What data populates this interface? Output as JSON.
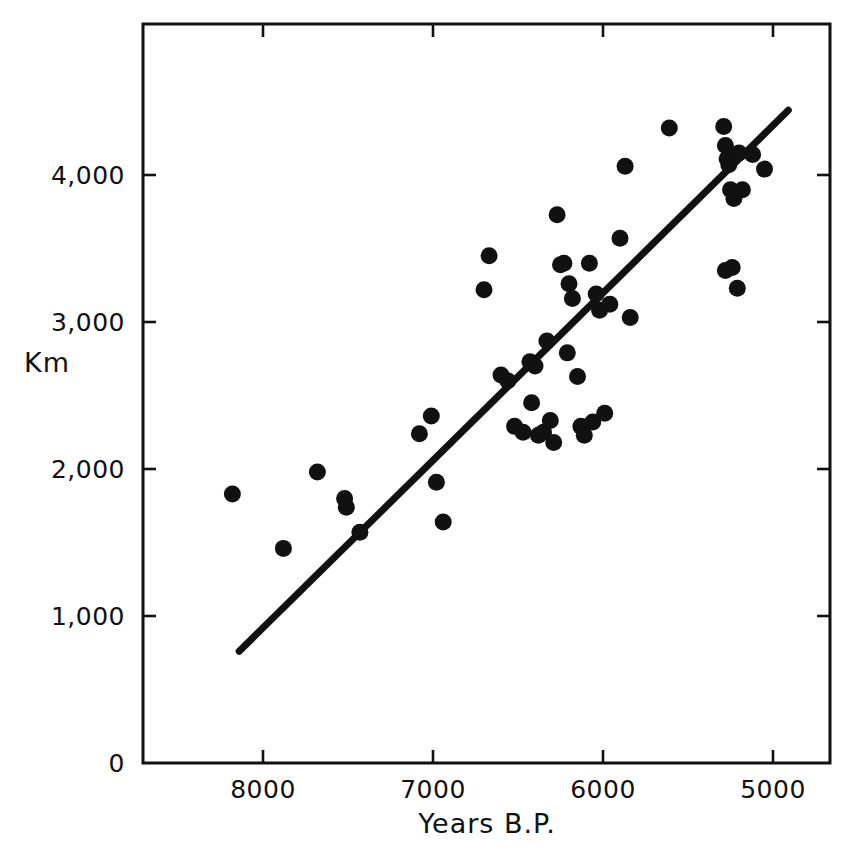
{
  "chart_data": {
    "type": "scatter",
    "title": "",
    "xlabel": "Years B.P.",
    "ylabel": "Km",
    "xlim": [
      8350,
      4670
    ],
    "ylim": [
      0,
      4500
    ],
    "x_ticks": [
      8000,
      7000,
      6000,
      5000
    ],
    "x_tick_labels": [
      "8000",
      "7000",
      "6000",
      "5000"
    ],
    "y_ticks": [
      0,
      1000,
      2000,
      3000,
      4000
    ],
    "y_tick_labels": [
      "0",
      "1,000",
      "2,000",
      "3,000",
      "4,000"
    ],
    "x_axis_inverted": true,
    "grid": false,
    "legend": false,
    "marker_color": "#111111",
    "line_color": "#111111",
    "points": [
      {
        "x": 8180,
        "y": 1830
      },
      {
        "x": 7880,
        "y": 1460
      },
      {
        "x": 7680,
        "y": 1980
      },
      {
        "x": 7520,
        "y": 1800
      },
      {
        "x": 7510,
        "y": 1740
      },
      {
        "x": 7430,
        "y": 1570
      },
      {
        "x": 7080,
        "y": 2240
      },
      {
        "x": 7010,
        "y": 2360
      },
      {
        "x": 6980,
        "y": 1910
      },
      {
        "x": 6940,
        "y": 1640
      },
      {
        "x": 6700,
        "y": 3220
      },
      {
        "x": 6670,
        "y": 3450
      },
      {
        "x": 6600,
        "y": 2640
      },
      {
        "x": 6560,
        "y": 2600
      },
      {
        "x": 6520,
        "y": 2290
      },
      {
        "x": 6470,
        "y": 2250
      },
      {
        "x": 6430,
        "y": 2730
      },
      {
        "x": 6420,
        "y": 2450
      },
      {
        "x": 6400,
        "y": 2700
      },
      {
        "x": 6380,
        "y": 2230
      },
      {
        "x": 6350,
        "y": 2250
      },
      {
        "x": 6330,
        "y": 2870
      },
      {
        "x": 6310,
        "y": 2330
      },
      {
        "x": 6290,
        "y": 2180
      },
      {
        "x": 6270,
        "y": 3730
      },
      {
        "x": 6250,
        "y": 3390
      },
      {
        "x": 6230,
        "y": 3400
      },
      {
        "x": 6210,
        "y": 2790
      },
      {
        "x": 6200,
        "y": 3260
      },
      {
        "x": 6180,
        "y": 3160
      },
      {
        "x": 6150,
        "y": 2630
      },
      {
        "x": 6130,
        "y": 2290
      },
      {
        "x": 6110,
        "y": 2230
      },
      {
        "x": 6080,
        "y": 3400
      },
      {
        "x": 6060,
        "y": 2320
      },
      {
        "x": 6040,
        "y": 3190
      },
      {
        "x": 6020,
        "y": 3080
      },
      {
        "x": 5990,
        "y": 2380
      },
      {
        "x": 5960,
        "y": 3120
      },
      {
        "x": 5900,
        "y": 3570
      },
      {
        "x": 5870,
        "y": 4060
      },
      {
        "x": 5840,
        "y": 3030
      },
      {
        "x": 5610,
        "y": 4320
      },
      {
        "x": 5290,
        "y": 4330
      },
      {
        "x": 5280,
        "y": 4200
      },
      {
        "x": 5270,
        "y": 4110
      },
      {
        "x": 5260,
        "y": 4070
      },
      {
        "x": 5250,
        "y": 3900
      },
      {
        "x": 5230,
        "y": 3840
      },
      {
        "x": 5200,
        "y": 4150
      },
      {
        "x": 5180,
        "y": 3900
      },
      {
        "x": 5120,
        "y": 4140
      },
      {
        "x": 5050,
        "y": 4040
      },
      {
        "x": 5280,
        "y": 3350
      },
      {
        "x": 5240,
        "y": 3370
      },
      {
        "x": 5210,
        "y": 3230
      }
    ],
    "trend_line": {
      "label": "regression line",
      "start": {
        "x": 8140,
        "y": 760
      },
      "end": {
        "x": 4910,
        "y": 4440
      }
    }
  },
  "geometry": {
    "plot_left": 143,
    "plot_right": 830,
    "plot_top": 24,
    "plot_bottom": 763,
    "x_pixel_at_8000": 263,
    "pixels_per_1000_years": 170,
    "y_pixel_at_0": 763,
    "pixels_per_1000_km": 147
  }
}
